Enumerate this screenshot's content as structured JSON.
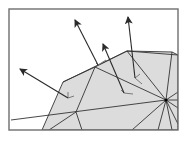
{
  "figure": {
    "colors": {
      "background": "#ffffff",
      "frame": "#6e6e6e",
      "mesh_fill": "#dcdcdc",
      "mesh_edge": "#333333",
      "normal_arrow": "#2a2a2a",
      "tangent_mark": "#7a7a7a"
    },
    "frame": {
      "x": 9,
      "y": 9,
      "width": 169,
      "height": 121
    },
    "mesh": {
      "outline": [
        [
          42,
          130
        ],
        [
          63,
          82
        ],
        [
          95,
          67
        ],
        [
          127,
          51
        ],
        [
          172,
          52
        ],
        [
          178,
          55
        ],
        [
          178,
          130
        ]
      ],
      "hub_vertex": [
        166,
        100
      ],
      "edges": [
        [
          [
            63,
            82
          ],
          [
            127,
            51
          ]
        ],
        [
          [
            95,
            67
          ],
          [
            166,
            100
          ]
        ],
        [
          [
            127,
            51
          ],
          [
            166,
            100
          ]
        ],
        [
          [
            95,
            67
          ],
          [
            76,
            112
          ]
        ],
        [
          [
            76,
            112
          ],
          [
            82,
            130
          ]
        ],
        [
          [
            76,
            112
          ],
          [
            49,
            130
          ]
        ],
        [
          [
            11,
            120
          ],
          [
            166,
            100
          ]
        ],
        [
          [
            172,
            52
          ],
          [
            166,
            100
          ]
        ],
        [
          [
            166,
            100
          ],
          [
            178,
            92
          ]
        ],
        [
          [
            166,
            100
          ],
          [
            178,
            100
          ]
        ],
        [
          [
            166,
            100
          ],
          [
            178,
            108
          ]
        ],
        [
          [
            166,
            100
          ],
          [
            132,
            130
          ]
        ],
        [
          [
            166,
            100
          ],
          [
            158,
            130
          ]
        ],
        [
          [
            166,
            100
          ],
          [
            172,
            130
          ]
        ],
        [
          [
            166,
            100
          ],
          [
            178,
            124
          ]
        ],
        [
          [
            127,
            51
          ],
          [
            178,
            55
          ]
        ]
      ]
    },
    "normals": [
      {
        "base": [
          68,
          98
        ],
        "tip": [
          20,
          69
        ],
        "tangent": [
          [
            68,
            98
          ],
          [
            68,
            92
          ]
        ],
        "tangent2": [
          [
            68,
            98
          ],
          [
            74,
            96
          ]
        ]
      },
      {
        "base": [
          124,
          93
        ],
        "tip": [
          103,
          44
        ],
        "tangent": [
          [
            124,
            93
          ],
          [
            133,
            94
          ]
        ],
        "tangent2": [
          [
            124,
            93
          ],
          [
            121,
            90
          ]
        ]
      },
      {
        "base": [
          135,
          78
        ],
        "tip": [
          128,
          17
        ],
        "tangent": [
          [
            135,
            78
          ],
          [
            140,
            74
          ]
        ],
        "tangent2": [
          [
            135,
            78
          ],
          [
            142,
            84
          ]
        ]
      },
      {
        "base": [
          98,
          65
        ],
        "tip": [
          75,
          20
        ],
        "tangent": [
          [
            98,
            65
          ],
          [
            106,
            60
          ]
        ],
        "tangent2": [
          [
            98,
            65
          ],
          [
            96,
            63
          ]
        ]
      }
    ]
  }
}
